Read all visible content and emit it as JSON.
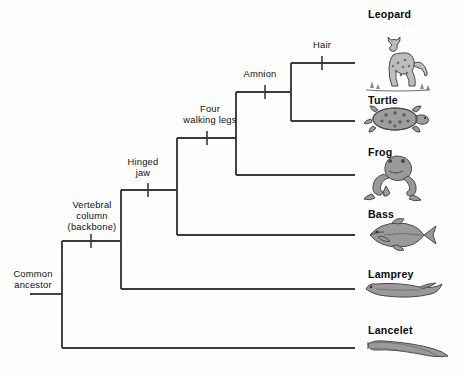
{
  "figure": {
    "type": "cladogram",
    "root_label": "Common\nancestor",
    "background_color": "#fdfdfd",
    "line_color": "#3a3a3a"
  },
  "node_labels": [
    {
      "id": "common-ancestor",
      "text": "Common\nancestor",
      "x": 4,
      "y": 268,
      "width": 58
    },
    {
      "id": "vertebral-column",
      "text": "Vertebral\ncolumn\n(backbone)",
      "x": 60,
      "y": 199,
      "width": 64
    },
    {
      "id": "hinged-jaw",
      "text": "Hinged\njaw",
      "x": 120,
      "y": 156,
      "width": 46
    },
    {
      "id": "four-walking-legs",
      "text": "Four\nwalking legs",
      "x": 177,
      "y": 103,
      "width": 66
    },
    {
      "id": "amnion",
      "text": "Amnion",
      "x": 238,
      "y": 68,
      "width": 44
    },
    {
      "id": "hair",
      "text": "Hair",
      "x": 303,
      "y": 39,
      "width": 38
    }
  ],
  "taxa": [
    {
      "id": "leopard",
      "label": "Leopard",
      "label_x": 368,
      "label_y": 8,
      "branch_y": 63,
      "art": "leopard"
    },
    {
      "id": "turtle",
      "label": "Turtle",
      "label_x": 368,
      "label_y": 94,
      "branch_y": 121,
      "art": "turtle"
    },
    {
      "id": "frog",
      "label": "Frog",
      "label_x": 368,
      "label_y": 146,
      "branch_y": 175,
      "art": "frog"
    },
    {
      "id": "bass",
      "label": "Bass",
      "label_x": 368,
      "label_y": 208,
      "branch_y": 235,
      "art": "bass"
    },
    {
      "id": "lamprey",
      "label": "Lamprey",
      "label_x": 368,
      "label_y": 268,
      "branch_y": 289,
      "art": "lamprey"
    },
    {
      "id": "lancelet",
      "label": "Lancelet",
      "label_x": 368,
      "label_y": 324,
      "branch_y": 348,
      "art": "lancelet"
    }
  ],
  "tick_marks": [
    {
      "id": "tick-vertebral-column",
      "x": 91,
      "y": 241
    },
    {
      "id": "tick-hinged-jaw",
      "x": 148,
      "y": 190
    },
    {
      "id": "tick-four-walking-legs",
      "x": 207,
      "y": 138
    },
    {
      "id": "tick-amnion",
      "x": 265,
      "y": 92
    },
    {
      "id": "tick-hair",
      "x": 322,
      "y": 63
    }
  ],
  "geometry": {
    "root_x": 62,
    "root_stub_left": 30,
    "node_vertebral_x": 121,
    "node_jaw_x": 177,
    "node_legs_x": 236,
    "node_amnion_x": 291,
    "tip_x": 355,
    "root_y": 294,
    "lancelet_y": 348,
    "vertebral_y": 241,
    "jaw_y": 190,
    "legs_y": 138,
    "amnion_y": 92,
    "leopard_y": 63,
    "turtle_y": 121,
    "frog_y": 175,
    "bass_y": 235,
    "lamprey_y": 289
  }
}
